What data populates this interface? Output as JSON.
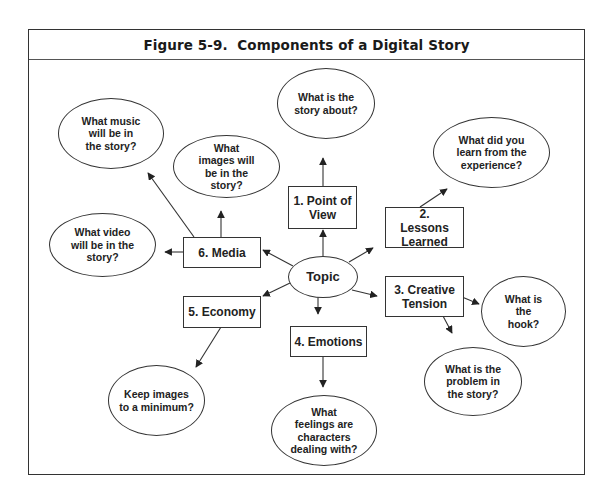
{
  "figure": {
    "title": "Figure 5-9.  Components of a Digital Story"
  },
  "center": {
    "label": "Topic"
  },
  "components": [
    {
      "id": "point-of-view",
      "label": "1. Point of View",
      "questions": [
        "What is the story about?"
      ]
    },
    {
      "id": "lessons-learned",
      "label": "2. Lessons Learned",
      "questions": [
        "What did you learn from the experience?"
      ]
    },
    {
      "id": "creative-tension",
      "label": "3. Creative Tension",
      "questions": [
        "What is the hook?",
        "What is the problem in the story?"
      ]
    },
    {
      "id": "emotions",
      "label": "4. Emotions",
      "questions": [
        "What feelings are characters dealing with?"
      ]
    },
    {
      "id": "economy",
      "label": "5. Economy",
      "questions": [
        "Keep images to a minimum?"
      ]
    },
    {
      "id": "media",
      "label": "6. Media",
      "questions": [
        "What music will be in the story?",
        "What images will be in the story?",
        "What video will be in the story?"
      ]
    }
  ],
  "colors": {
    "line": "#333333",
    "text": "#222222",
    "background": "#ffffff"
  }
}
